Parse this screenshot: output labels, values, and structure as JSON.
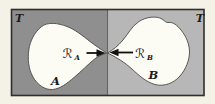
{
  "figure": {
    "left_region": {
      "label": "T",
      "color": "#8f8f8f"
    },
    "right_region": {
      "label": "T",
      "color": "#b7b7b7"
    },
    "set_a": {
      "label": "A"
    },
    "set_b": {
      "label": "B"
    },
    "retract_a": {
      "symbol": "ℛ",
      "subscript": "A"
    },
    "retract_b": {
      "symbol": "ℛ",
      "subscript": "B"
    },
    "colors": {
      "background": "#f4f1e6",
      "blob_fill": "#fcfbf4",
      "blob_outline": "#4a4a4a",
      "frame_outline": "#2e2e2e",
      "divider": "#666666",
      "arrow": "#111111"
    }
  }
}
